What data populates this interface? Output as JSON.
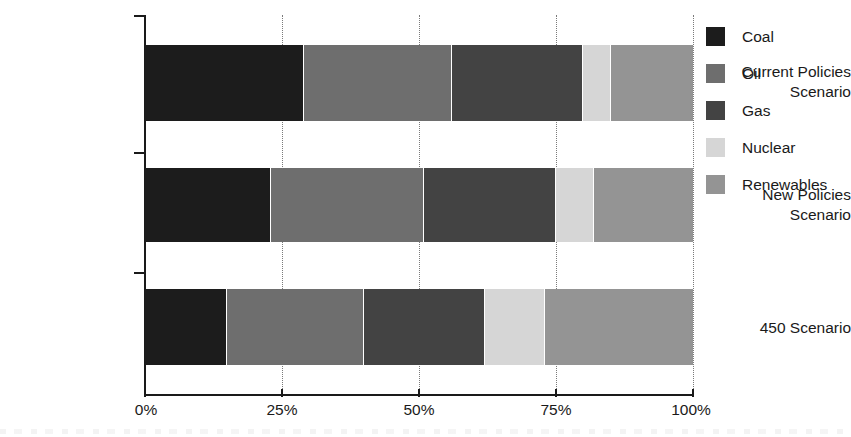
{
  "chart_data": {
    "type": "bar",
    "orientation": "horizontal",
    "stacked": true,
    "normalized": true,
    "title": "",
    "xlabel": "",
    "ylabel": "",
    "xlim": [
      0,
      100
    ],
    "grid": true,
    "legend_position": "right",
    "categories": [
      "Current Policies\nScenario",
      "New Policies\nScenario",
      "450 Scenario"
    ],
    "xticks": [
      "0%",
      "25%",
      "50%",
      "75%",
      "100%"
    ],
    "xtick_values": [
      0,
      25,
      50,
      75,
      100
    ],
    "series": [
      {
        "name": "Coal",
        "color": "#1c1c1c",
        "values": [
          29,
          23,
          15
        ]
      },
      {
        "name": "Oil",
        "color": "#6e6e6e",
        "values": [
          27,
          28,
          25
        ]
      },
      {
        "name": "Gas",
        "color": "#434343",
        "values": [
          24,
          24,
          22
        ]
      },
      {
        "name": "Nuclear",
        "color": "#d6d6d6",
        "values": [
          5,
          7,
          11
        ]
      },
      {
        "name": "Renewables",
        "color": "#949494",
        "values": [
          15,
          18,
          27
        ]
      }
    ]
  },
  "legend": {
    "items": [
      {
        "label": "Coal",
        "color": "#1c1c1c"
      },
      {
        "label": "Oil",
        "color": "#6e6e6e"
      },
      {
        "label": "Gas",
        "color": "#434343"
      },
      {
        "label": "Nuclear",
        "color": "#d6d6d6"
      },
      {
        "label": "Renewables",
        "color": "#949494"
      }
    ]
  },
  "axis": {
    "x_labels": [
      "0%",
      "25%",
      "50%",
      "75%",
      "100%"
    ],
    "y_labels": [
      "Current Policies\nScenario",
      "New Policies\nScenario",
      "450 Scenario"
    ]
  }
}
